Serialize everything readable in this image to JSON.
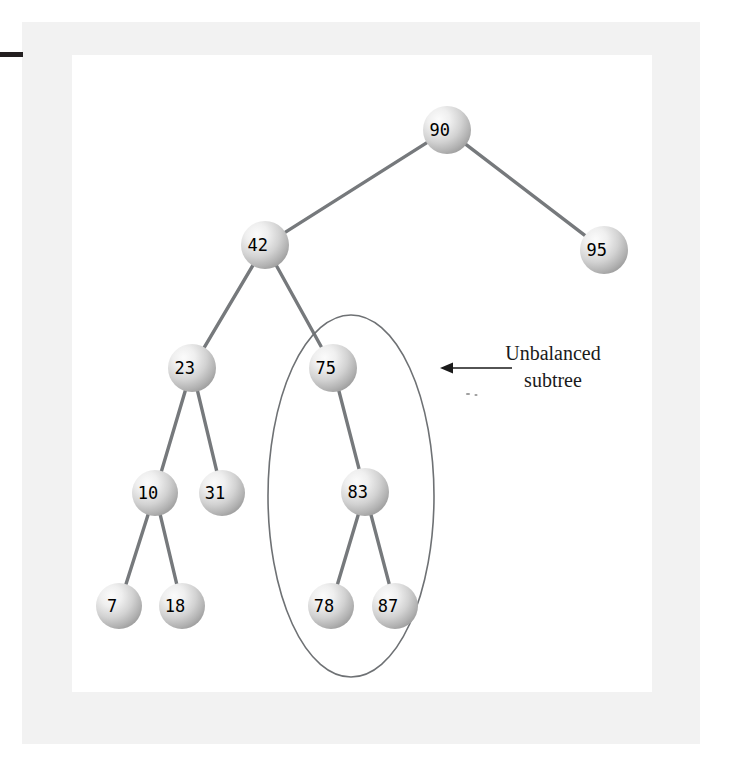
{
  "figure": {
    "background_color": "#ffffff",
    "frame_color": "#f2f2f2",
    "node_fill_light": "#f4f4f4",
    "node_fill_dark": "#9a9a9a",
    "edge_color": "#76797c",
    "ellipse_color": "#6e7174",
    "annotation_color": "#1a1a1a"
  },
  "chart_data": {
    "type": "diagram",
    "subtype": "binary-search-tree",
    "nodes": [
      {
        "id": "n90",
        "label": "90",
        "cx": 447,
        "cy": 130,
        "r": 24,
        "depth": 0
      },
      {
        "id": "n42",
        "label": "42",
        "cx": 265,
        "cy": 245,
        "r": 24,
        "depth": 1
      },
      {
        "id": "n95",
        "label": "95",
        "cx": 604,
        "cy": 250,
        "r": 24,
        "depth": 1
      },
      {
        "id": "n23",
        "label": "23",
        "cx": 192,
        "cy": 368,
        "r": 24,
        "depth": 2
      },
      {
        "id": "n75",
        "label": "75",
        "cx": 333,
        "cy": 368,
        "r": 24,
        "depth": 2
      },
      {
        "id": "n10",
        "label": "10",
        "cx": 155,
        "cy": 493,
        "r": 23,
        "depth": 3
      },
      {
        "id": "n31",
        "label": "31",
        "cx": 222,
        "cy": 493,
        "r": 23,
        "depth": 3
      },
      {
        "id": "n83",
        "label": "83",
        "cx": 365,
        "cy": 492,
        "r": 24,
        "depth": 3
      },
      {
        "id": "n7",
        "label": "7",
        "cx": 119,
        "cy": 606,
        "r": 23,
        "depth": 4
      },
      {
        "id": "n18",
        "label": "18",
        "cx": 182,
        "cy": 606,
        "r": 23,
        "depth": 4
      },
      {
        "id": "n78",
        "label": "78",
        "cx": 331,
        "cy": 606,
        "r": 23,
        "depth": 4
      },
      {
        "id": "n87",
        "label": "87",
        "cx": 395,
        "cy": 606,
        "r": 23,
        "depth": 4
      }
    ],
    "edges": [
      {
        "from": "n90",
        "to": "n42"
      },
      {
        "from": "n90",
        "to": "n95"
      },
      {
        "from": "n42",
        "to": "n23"
      },
      {
        "from": "n42",
        "to": "n75"
      },
      {
        "from": "n23",
        "to": "n10"
      },
      {
        "from": "n23",
        "to": "n31"
      },
      {
        "from": "n10",
        "to": "n7"
      },
      {
        "from": "n10",
        "to": "n18"
      },
      {
        "from": "n75",
        "to": "n83"
      },
      {
        "from": "n83",
        "to": "n78"
      },
      {
        "from": "n83",
        "to": "n87"
      }
    ],
    "highlight": {
      "shape": "ellipse",
      "cx": 351,
      "cy": 496,
      "rx": 83,
      "ry": 181,
      "encloses": [
        "n75",
        "n83",
        "n78",
        "n87"
      ]
    },
    "annotation": {
      "line1": "Unbalanced",
      "line2": "subtree",
      "text_x": 553,
      "line1_y": 360,
      "line2_y": 387,
      "arrow": {
        "x_start": 512,
        "x_end": 440,
        "y": 368,
        "direction": "left"
      }
    }
  }
}
